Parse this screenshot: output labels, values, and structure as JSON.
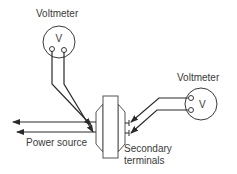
{
  "diagram": {
    "title": "",
    "labels": {
      "voltmeter_top": "Voltmeter",
      "voltmeter_right": "Voltmeter",
      "voltmeter_symbol_top": "V",
      "voltmeter_symbol_right": "V",
      "power_source": "Power source",
      "secondary_line1": "Secondary",
      "secondary_line2": "terminals"
    },
    "nodes": [
      {
        "id": "voltmeter-1",
        "label": "Voltmeter",
        "symbol": "V"
      },
      {
        "id": "voltmeter-2",
        "label": "Voltmeter",
        "symbol": "V"
      },
      {
        "id": "transformer",
        "label": ""
      },
      {
        "id": "power-source",
        "label": "Power source"
      },
      {
        "id": "secondary-terminals",
        "label": "Secondary terminals"
      }
    ],
    "edges": [
      {
        "from": "voltmeter-1",
        "to": "transformer",
        "desc": "two leads to primary side"
      },
      {
        "from": "voltmeter-2",
        "to": "secondary-terminals",
        "desc": "two leads to secondary terminals"
      },
      {
        "from": "transformer",
        "to": "power-source",
        "desc": "two arrows leftward"
      }
    ],
    "colors": {
      "stroke": "#3a3a3a",
      "background": "#ffffff"
    }
  }
}
